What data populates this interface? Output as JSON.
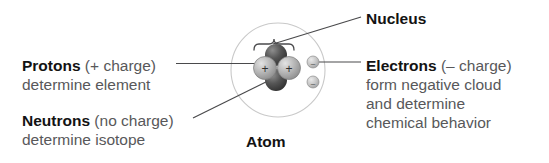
{
  "diagram": {
    "caption": "Atom",
    "colors": {
      "keyword_text": "#131313",
      "secondary_text": "#58585a",
      "leader_line": "#4a4a4c",
      "cloud_circle": "#c8c8c8",
      "proton_fill": "#a9a9a9",
      "neutron_fill": "#4e4e4e",
      "electron_fill": "#b5b5b5"
    },
    "labels": {
      "protons": {
        "keyword": "Protons",
        "qualifier": " (+ charge)",
        "line2": "determine element"
      },
      "neutrons": {
        "keyword": "Neutrons",
        "qualifier": " (no charge)",
        "line2": "determine isotope"
      },
      "nucleus": {
        "keyword": "Nucleus"
      },
      "electrons": {
        "keyword": "Electrons",
        "qualifier": " (– charge)",
        "line2": "form negative cloud",
        "line3": "and determine",
        "line4": "chemical behavior"
      }
    },
    "particles": {
      "proton_sign": "+",
      "neutron_sign": "",
      "electron_sign": "–",
      "proton_count": 2,
      "neutron_count": 2,
      "electron_count": 2
    }
  }
}
